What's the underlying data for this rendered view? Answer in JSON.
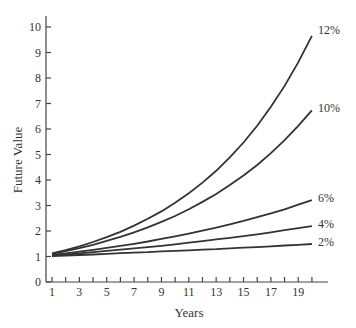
{
  "chart_data": {
    "type": "line",
    "title": "",
    "xlabel": "Years",
    "ylabel": "Future Value",
    "xlim": [
      1,
      20
    ],
    "ylim": [
      0,
      10
    ],
    "x_ticks": [
      1,
      3,
      5,
      7,
      9,
      11,
      13,
      15,
      17,
      19
    ],
    "x_minor_ticks": [
      1,
      2,
      3,
      4,
      5,
      6,
      7,
      8,
      9,
      10,
      11,
      12,
      13,
      14,
      15,
      16,
      17,
      18,
      19,
      20
    ],
    "y_ticks": [
      0,
      1,
      2,
      3,
      4,
      5,
      6,
      7,
      8,
      9,
      10
    ],
    "grid": false,
    "legend": "inline labels at right end of each curve",
    "x": [
      1,
      2,
      3,
      4,
      5,
      6,
      7,
      8,
      9,
      10,
      11,
      12,
      13,
      14,
      15,
      16,
      17,
      18,
      19,
      20
    ],
    "series": [
      {
        "name": "12%",
        "rate": 0.12,
        "values": [
          1.12,
          1.25,
          1.4,
          1.57,
          1.76,
          1.97,
          2.21,
          2.48,
          2.77,
          3.11,
          3.48,
          3.9,
          4.36,
          4.89,
          5.47,
          6.13,
          6.87,
          7.69,
          8.61,
          9.65
        ]
      },
      {
        "name": "10%",
        "rate": 0.1,
        "values": [
          1.1,
          1.21,
          1.33,
          1.46,
          1.61,
          1.77,
          1.95,
          2.14,
          2.36,
          2.59,
          2.85,
          3.14,
          3.45,
          3.8,
          4.18,
          4.59,
          5.05,
          5.56,
          6.12,
          6.73
        ]
      },
      {
        "name": "6%",
        "rate": 0.06,
        "values": [
          1.06,
          1.12,
          1.19,
          1.26,
          1.34,
          1.42,
          1.5,
          1.59,
          1.69,
          1.79,
          1.9,
          2.01,
          2.13,
          2.26,
          2.4,
          2.54,
          2.69,
          2.85,
          3.03,
          3.21
        ]
      },
      {
        "name": "4%",
        "rate": 0.04,
        "values": [
          1.04,
          1.08,
          1.12,
          1.17,
          1.22,
          1.27,
          1.32,
          1.37,
          1.42,
          1.48,
          1.54,
          1.6,
          1.67,
          1.73,
          1.8,
          1.87,
          1.95,
          2.03,
          2.11,
          2.19
        ]
      },
      {
        "name": "2%",
        "rate": 0.02,
        "values": [
          1.02,
          1.04,
          1.06,
          1.08,
          1.1,
          1.13,
          1.15,
          1.17,
          1.2,
          1.22,
          1.24,
          1.27,
          1.29,
          1.32,
          1.35,
          1.37,
          1.4,
          1.43,
          1.46,
          1.49
        ]
      }
    ]
  }
}
